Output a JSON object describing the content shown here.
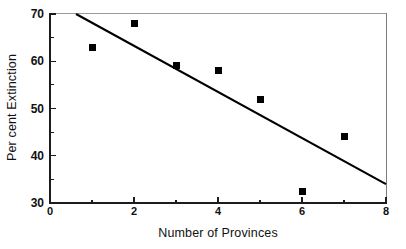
{
  "chart_data": {
    "type": "scatter",
    "title": "",
    "xlabel": "Number of Provinces",
    "ylabel": "Per cent Extinction",
    "xlim": [
      0,
      8
    ],
    "ylim": [
      30,
      70
    ],
    "grid": false,
    "legend": null,
    "x_major_ticks": [
      "0",
      "2",
      "4",
      "6",
      "8"
    ],
    "x_major_tick_values": [
      0,
      2,
      4,
      6,
      8
    ],
    "x_minor_tick_values": [
      1,
      3,
      5,
      7
    ],
    "y_major_ticks": [
      "30",
      "40",
      "50",
      "60",
      "70"
    ],
    "y_major_tick_values": [
      30,
      40,
      50,
      60,
      70
    ],
    "y_minor_tick_values": [
      35,
      45,
      55,
      65
    ],
    "marker_style": "filled-square",
    "marker_color": "#000000",
    "points": [
      {
        "x": 1,
        "y": 63
      },
      {
        "x": 2,
        "y": 68
      },
      {
        "x": 3,
        "y": 59
      },
      {
        "x": 4,
        "y": 58
      },
      {
        "x": 5,
        "y": 52
      },
      {
        "x": 6,
        "y": 32.5
      },
      {
        "x": 7,
        "y": 44
      }
    ],
    "series": [
      {
        "name": "Per cent Extinction",
        "x": [
          1,
          2,
          3,
          4,
          5,
          6,
          7
        ],
        "values": [
          63,
          68,
          59,
          58,
          52,
          32.5,
          44
        ]
      }
    ],
    "trend_line": {
      "type": "linear-fit",
      "color": "#000000",
      "start": {
        "x": 0.62,
        "y": 70
      },
      "end": {
        "x": 8,
        "y": 34
      }
    }
  }
}
